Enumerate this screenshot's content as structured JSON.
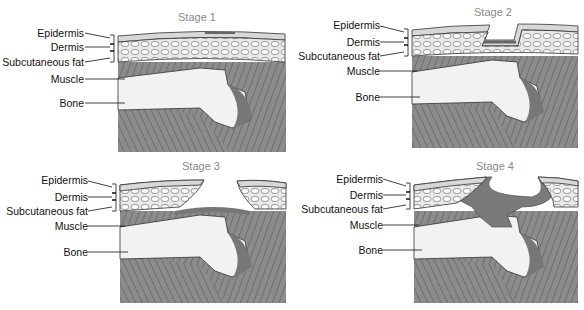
{
  "figure": {
    "panels": [
      {
        "title": "Stage 1",
        "labels": [
          "Epidermis",
          "Dermis",
          "Subcutaneous fat",
          "Muscle",
          "Bone"
        ]
      },
      {
        "title": "Stage 2",
        "labels": [
          "Epidermis",
          "Dermis",
          "Subcutaneous fat",
          "Muscle",
          "Bone"
        ]
      },
      {
        "title": "Stage 3",
        "labels": [
          "Epidermis",
          "Dermis",
          "Subcutaneous fat",
          "Muscle",
          "Bone"
        ]
      },
      {
        "title": "Stage 4",
        "labels": [
          "Epidermis",
          "Dermis",
          "Subcutaneous fat",
          "Muscle",
          "Bone"
        ]
      }
    ],
    "colors": {
      "skin": "#d8d8d8",
      "fat": "#f4f4f4",
      "muscle": "#8c8c8c",
      "bone": "#f2f2f2",
      "wound": "#7a7a7a",
      "title": "#8a8a8a"
    }
  }
}
